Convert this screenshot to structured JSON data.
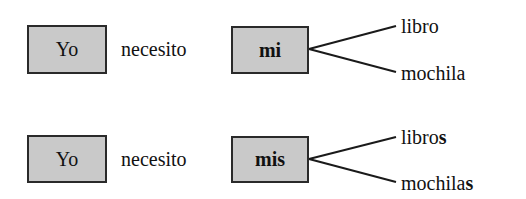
{
  "rows": [
    {
      "subject": "Yo",
      "verb": "necesito",
      "possessive": "mi",
      "branches": [
        {
          "stem": "libro",
          "ending": ""
        },
        {
          "stem": "mochila",
          "ending": ""
        }
      ]
    },
    {
      "subject": "Yo",
      "verb": "necesito",
      "possessive": "mis",
      "branches": [
        {
          "stem": "libro",
          "ending": "s"
        },
        {
          "stem": "mochila",
          "ending": "s"
        }
      ]
    }
  ],
  "colors": {
    "box_fill": "#c9c9c9",
    "box_border": "#2a2a2a",
    "text": "#111111"
  }
}
